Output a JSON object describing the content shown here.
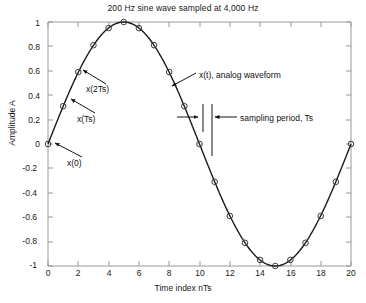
{
  "figure": {
    "title": "200 Hz sine wave sampled at 4,000 Hz",
    "xlabel": "Time index nTs",
    "ylabel": "Amplitude A",
    "caption_fragment": ""
  },
  "annotations": [
    {
      "key": "x2ts",
      "label": "x(2Ts)"
    },
    {
      "key": "xts",
      "label": "x(Ts)"
    },
    {
      "key": "x0",
      "label": "x(0)"
    },
    {
      "key": "xt",
      "label": "x(t), analog waveform"
    },
    {
      "key": "period",
      "label": "sampling period, Ts"
    }
  ],
  "ticks": {
    "x": [
      "0",
      "2",
      "4",
      "6",
      "8",
      "10",
      "12",
      "14",
      "16",
      "18",
      "20"
    ],
    "y": [
      "1",
      "0.8",
      "0.6",
      "0.4",
      "0.2",
      "0",
      "-0.2",
      "-0.4",
      "-0.6",
      "-0.8",
      "-1"
    ]
  },
  "colors": {
    "curve": "#1a1a1a",
    "marker_stroke": "#3a3a3a",
    "axis": "#9a9a9a",
    "text": "#171717",
    "background": "#ffffff"
  },
  "chart_data": {
    "type": "line",
    "title": "200 Hz sine wave sampled at 4,000 Hz",
    "xlabel": "Time index nTs",
    "ylabel": "Amplitude A",
    "xlim": [
      0,
      20
    ],
    "ylim": [
      -1,
      1
    ],
    "xticks": [
      0,
      2,
      4,
      6,
      8,
      10,
      12,
      14,
      16,
      18,
      20
    ],
    "yticks": [
      -1,
      -0.8,
      -0.6,
      -0.4,
      -0.2,
      0,
      0.2,
      0.4,
      0.6,
      0.8,
      1
    ],
    "grid": false,
    "legend": "none",
    "marker": "circle-open",
    "series": [
      {
        "name": "x(nTs), sampled sine",
        "x": [
          0,
          1,
          2,
          3,
          4,
          5,
          6,
          7,
          8,
          9,
          10,
          11,
          12,
          13,
          14,
          15,
          16,
          17,
          18,
          19,
          20
        ],
        "values": [
          0.0,
          0.31,
          0.59,
          0.81,
          0.95,
          1.0,
          0.95,
          0.81,
          0.59,
          0.31,
          0.0,
          -0.31,
          -0.59,
          -0.81,
          -0.95,
          -1.0,
          -0.95,
          -0.81,
          -0.59,
          -0.31,
          0.0
        ]
      },
      {
        "name": "x(t), analog waveform",
        "expression": "sin(2*pi*n/20)"
      }
    ],
    "annotations": [
      {
        "text": "x(0)",
        "points_to": [
          0,
          0.0
        ]
      },
      {
        "text": "x(Ts)",
        "points_to": [
          1,
          0.31
        ]
      },
      {
        "text": "x(2Ts)",
        "points_to": [
          2,
          0.59
        ]
      },
      {
        "text": "x(t), analog waveform",
        "points_to": [
          8.6,
          0.45
        ]
      },
      {
        "text": "sampling period, Ts",
        "spans": [
          10,
          11
        ]
      }
    ]
  }
}
